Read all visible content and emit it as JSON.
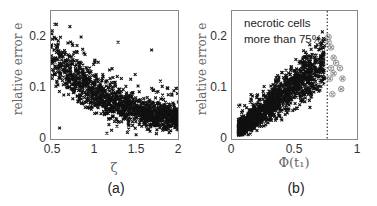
{
  "chart_data": [
    {
      "type": "scatter",
      "panel_caption": "(a)",
      "title": "",
      "xlabel": "ζ",
      "ylabel": "relative error e",
      "xlim": [
        0.5,
        2
      ],
      "ylim": [
        0,
        0.25
      ],
      "xticks": [
        "0.5",
        "1",
        "1.5",
        "2"
      ],
      "yticks": [
        "0",
        "0.1",
        "0.2"
      ],
      "grid": false,
      "series": [
        {
          "name": "samples",
          "marker": "x",
          "color": "#111111",
          "trend": "decreasing; e≈0.15 at ζ=0.5 to e≈0.03 at ζ=2, dense band with sparse outliers up to ~0.22",
          "approx_points": [
            [
              0.5,
              0.18
            ],
            [
              0.55,
              0.16
            ],
            [
              0.6,
              0.14
            ],
            [
              0.7,
              0.12
            ],
            [
              0.8,
              0.11
            ],
            [
              0.9,
              0.09
            ],
            [
              1.0,
              0.08
            ],
            [
              1.1,
              0.07
            ],
            [
              1.2,
              0.06
            ],
            [
              1.3,
              0.055
            ],
            [
              1.4,
              0.05
            ],
            [
              1.5,
              0.045
            ],
            [
              1.6,
              0.04
            ],
            [
              1.7,
              0.035
            ],
            [
              1.8,
              0.033
            ],
            [
              1.9,
              0.03
            ],
            [
              2.0,
              0.028
            ],
            [
              0.72,
              0.22
            ],
            [
              0.85,
              0.2
            ],
            [
              1.28,
              0.19
            ],
            [
              1.67,
              0.175
            ],
            [
              0.6,
              0.025
            ],
            [
              1.15,
              0.015
            ]
          ]
        }
      ]
    },
    {
      "type": "scatter",
      "panel_caption": "(b)",
      "title": "",
      "xlabel": "Φ(t₁)",
      "ylabel": "relative error e",
      "xlim": [
        0,
        1
      ],
      "ylim": [
        0,
        0.25
      ],
      "xticks": [
        "0",
        "0.5",
        "1"
      ],
      "yticks": [
        "0",
        "0.1",
        "0.2"
      ],
      "grid": false,
      "annotation": {
        "line1": "necrotic cells",
        "line2": "more than 75%"
      },
      "vline": {
        "x": 0.75,
        "style": "dotted",
        "color": "#333333"
      },
      "series": [
        {
          "name": "samples",
          "marker": "x",
          "color": "#111111",
          "trend": "increasing; e≈0.02 at Φ=0.05 to e≈0.15 at Φ=0.7",
          "approx_points": [
            [
              0.05,
              0.02
            ],
            [
              0.1,
              0.03
            ],
            [
              0.15,
              0.04
            ],
            [
              0.2,
              0.045
            ],
            [
              0.25,
              0.055
            ],
            [
              0.3,
              0.06
            ],
            [
              0.35,
              0.07
            ],
            [
              0.4,
              0.08
            ],
            [
              0.45,
              0.09
            ],
            [
              0.5,
              0.1
            ],
            [
              0.55,
              0.11
            ],
            [
              0.6,
              0.12
            ],
            [
              0.65,
              0.14
            ],
            [
              0.7,
              0.15
            ],
            [
              0.72,
              0.17
            ]
          ]
        },
        {
          "name": "necrotic cells > 75%",
          "marker": "circled-x",
          "color": "#888888",
          "approx_points": [
            [
              0.76,
              0.2
            ],
            [
              0.78,
              0.18
            ],
            [
              0.8,
              0.16
            ],
            [
              0.82,
              0.15
            ],
            [
              0.78,
              0.14
            ],
            [
              0.8,
              0.13
            ],
            [
              0.77,
              0.12
            ],
            [
              0.85,
              0.14
            ],
            [
              0.87,
              0.12
            ],
            [
              0.86,
              0.1
            ],
            [
              0.79,
              0.09
            ],
            [
              0.76,
              0.19
            ]
          ]
        }
      ]
    }
  ]
}
